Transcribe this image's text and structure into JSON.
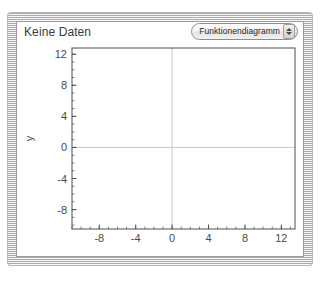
{
  "window": {
    "style": "brushed-metal-card"
  },
  "header": {
    "title": "Keine Daten",
    "popup": {
      "selected": "Funktionendiagramm",
      "stepper_up_icon": "triangle-up-icon",
      "stepper_down_icon": "triangle-down-icon"
    }
  },
  "colors": {
    "panel_bg": "#ffffff",
    "frame": "#4d4d4d",
    "tick_label": "#4a4a4a",
    "zero_line": "#c8c8c8",
    "window_border": "#b8b8b8"
  },
  "chart_data": {
    "type": "line",
    "title": "",
    "xlabel": "x",
    "ylabel": "y",
    "xlim": [
      -11,
      13.5
    ],
    "ylim": [
      -10.5,
      12.8
    ],
    "xticks": [
      -8,
      -4,
      0,
      4,
      8,
      12
    ],
    "yticks": [
      12,
      8,
      4,
      0,
      -4,
      -8
    ],
    "xtick_labels": [
      "-8",
      "-4",
      "0",
      "4",
      "8",
      "12"
    ],
    "ytick_labels": [
      "12",
      "8",
      "4",
      "0",
      "-4",
      "-8"
    ],
    "minor_tick_step": 1,
    "grid": false,
    "zero_axes": true,
    "legend": null,
    "series": [],
    "empty_state": "Keine Daten"
  }
}
